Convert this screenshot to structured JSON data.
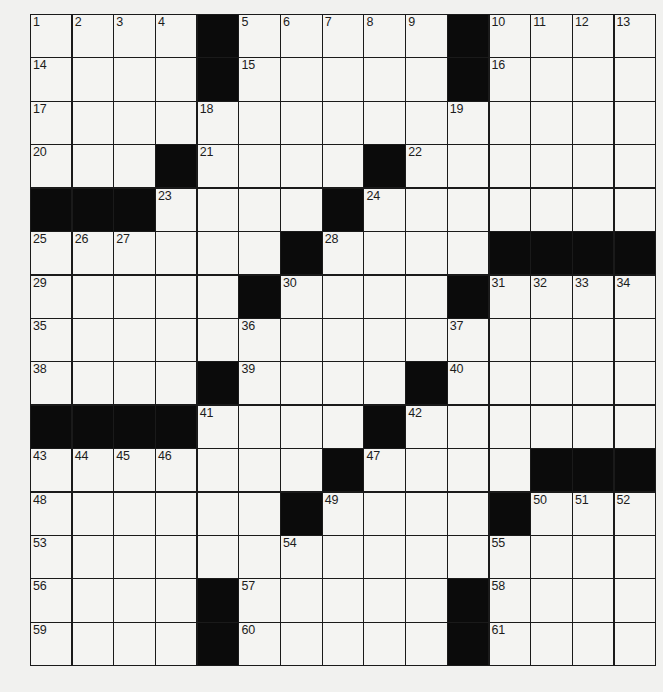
{
  "puzzle": {
    "rows": 15,
    "cols": 15,
    "grid": [
      [
        "1",
        "2",
        "3",
        "4",
        "#",
        "5",
        "6",
        "7",
        "8",
        "9",
        "#",
        "10",
        "11",
        "12",
        "13"
      ],
      [
        "14",
        "",
        "",
        "",
        "#",
        "15",
        "",
        "",
        "",
        "",
        "#",
        "16",
        "",
        "",
        ""
      ],
      [
        "17",
        "",
        "",
        "",
        "18",
        "",
        "",
        "",
        "",
        "",
        "19",
        "",
        "",
        "",
        ""
      ],
      [
        "20",
        "",
        "",
        "#",
        "21",
        "",
        "",
        "",
        "#",
        "22",
        "",
        "",
        "",
        "",
        ""
      ],
      [
        "#",
        "#",
        "#",
        "23",
        "",
        "",
        "",
        "#",
        "24",
        "",
        "",
        "",
        "",
        "",
        ""
      ],
      [
        "25",
        "26",
        "27",
        "",
        "",
        "",
        "#",
        "28",
        "",
        "",
        "",
        "#",
        "#",
        "#",
        "#"
      ],
      [
        "29",
        "",
        "",
        "",
        "",
        "#",
        "30",
        "",
        "",
        "",
        "#",
        "31",
        "32",
        "33",
        "34"
      ],
      [
        "35",
        "",
        "",
        "",
        "",
        "36",
        "",
        "",
        "",
        "",
        "37",
        "",
        "",
        "",
        ""
      ],
      [
        "38",
        "",
        "",
        "",
        "#",
        "39",
        "",
        "",
        "",
        "#",
        "40",
        "",
        "",
        "",
        ""
      ],
      [
        "#",
        "#",
        "#",
        "#",
        "41",
        "",
        "",
        "",
        "#",
        "42",
        "",
        "",
        "",
        "",
        ""
      ],
      [
        "43",
        "44",
        "45",
        "46",
        "",
        "",
        "",
        "#",
        "47",
        "",
        "",
        "",
        "#",
        "#",
        "#"
      ],
      [
        "48",
        "",
        "",
        "",
        "",
        "",
        "#",
        "49",
        "",
        "",
        "",
        "#",
        "50",
        "51",
        "52"
      ],
      [
        "53",
        "",
        "",
        "",
        "",
        "",
        "54",
        "",
        "",
        "",
        "",
        "55",
        "",
        "",
        ""
      ],
      [
        "56",
        "",
        "",
        "",
        "#",
        "57",
        "",
        "",
        "",
        "",
        "#",
        "58",
        "",
        "",
        ""
      ],
      [
        "59",
        "",
        "",
        "",
        "#",
        "60",
        "",
        "",
        "",
        "",
        "#",
        "61",
        "",
        "",
        ""
      ]
    ],
    "entries": []
  },
  "colors": {
    "black_square": "#0b0b0b",
    "white_square": "#f4f4f2",
    "grid_line": "#1a1a1a",
    "paper": "#f1f1ef"
  }
}
